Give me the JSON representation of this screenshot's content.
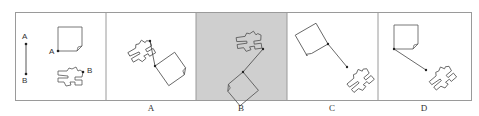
{
  "figure": {
    "type": "visual-reasoning-puzzle",
    "colors": {
      "frame": "#9a9a9a",
      "stroke": "#555555",
      "highlight_bg": "#cfcfcf",
      "background": "#ffffff"
    }
  },
  "reference": {
    "segment_top_label": "A",
    "segment_bottom_label": "B",
    "square_point_label": "A",
    "puzzle_point_label": "B"
  },
  "options": [
    {
      "label": "A",
      "highlighted": false
    },
    {
      "label": "B",
      "highlighted": true
    },
    {
      "label": "C",
      "highlighted": false
    },
    {
      "label": "D",
      "highlighted": false
    }
  ]
}
